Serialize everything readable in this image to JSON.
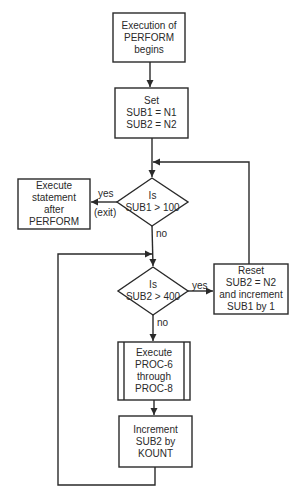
{
  "colors": {
    "stroke": "#2a2a2a",
    "background": "#ffffff"
  },
  "nodes": {
    "start": {
      "lines": [
        "Execution of",
        "PERFORM",
        "begins"
      ]
    },
    "init": {
      "lines": [
        "Set",
        "SUB1 = N1",
        "SUB2 = N2"
      ]
    },
    "decision1": {
      "lines": [
        "Is",
        "SUB1 > 100"
      ]
    },
    "exit": {
      "lines": [
        "Execute",
        "statement",
        "after",
        "PERFORM"
      ]
    },
    "decision2": {
      "lines": [
        "Is",
        "SUB2 > 400"
      ]
    },
    "reset": {
      "lines": [
        "Reset",
        "SUB2 = N2",
        "and increment",
        "SUB1 by 1"
      ]
    },
    "execute": {
      "lines": [
        "Execute",
        "PROC-6",
        "through",
        "PROC-8"
      ]
    },
    "increment": {
      "lines": [
        "Increment",
        "SUB2 by",
        "KOUNT"
      ]
    }
  },
  "edge_labels": {
    "d1_yes": "yes",
    "d1_exit": "(exit)",
    "d1_no": "no",
    "d2_yes": "yes",
    "d2_no": "no"
  }
}
